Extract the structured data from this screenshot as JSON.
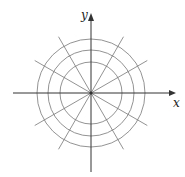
{
  "diagram": {
    "type": "polar-grid",
    "center": [
      91,
      93
    ],
    "circle_radii": [
      31,
      43,
      54
    ],
    "spoke_angles_deg": [
      30,
      60,
      120,
      150,
      210,
      240,
      300,
      330
    ],
    "spoke_length": 65,
    "axis_color": "#333333",
    "grid_color": "#777777",
    "axes": {
      "x_label": "x",
      "y_label": "y"
    }
  }
}
